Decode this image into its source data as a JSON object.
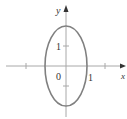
{
  "diagram": {
    "type": "ellipse-on-axes",
    "curve": {
      "center": [
        0,
        0
      ],
      "x_radius": 1,
      "y_radius": 2,
      "color": "#8a8a8a"
    },
    "axes": {
      "x_label": "x",
      "y_label": "y",
      "color": "#999999"
    },
    "labels": {
      "origin": "0",
      "x_tick": "1",
      "y_tick": "1"
    }
  }
}
